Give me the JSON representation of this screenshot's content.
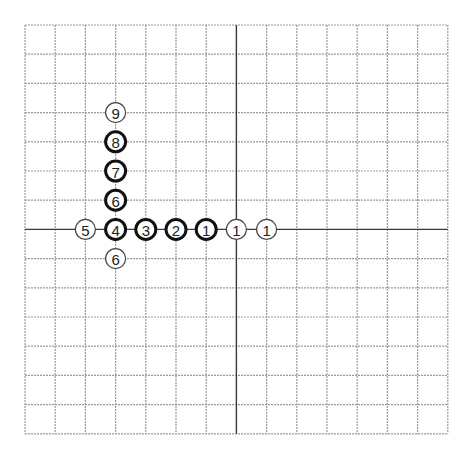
{
  "board": {
    "origin": [
      25,
      25
    ],
    "cols": 14,
    "rows": 14,
    "cell_w": 30.2,
    "cell_h": 29.2,
    "axis_col": 7,
    "axis_row": 7,
    "colors": {
      "grid": "#9a9a9a",
      "axis": "#3a3a3a",
      "stone_fill": "#ffffff",
      "stone_thick_stroke": "#111111",
      "stone_thin_stroke": "#444444",
      "label": "#222222"
    }
  },
  "stones": [
    {
      "label": "5",
      "col": 2,
      "row": 7,
      "style": "thin"
    },
    {
      "label": "4",
      "col": 3,
      "row": 7,
      "style": "thick"
    },
    {
      "label": "3",
      "col": 4,
      "row": 7,
      "style": "thick"
    },
    {
      "label": "2",
      "col": 5,
      "row": 7,
      "style": "thick"
    },
    {
      "label": "1",
      "col": 6,
      "row": 7,
      "style": "thick"
    },
    {
      "label": "1",
      "col": 7,
      "row": 7,
      "style": "thin"
    },
    {
      "label": "1",
      "col": 8,
      "row": 7,
      "style": "thin"
    },
    {
      "label": "9",
      "col": 3,
      "row": 3,
      "style": "thin"
    },
    {
      "label": "8",
      "col": 3,
      "row": 4,
      "style": "thick"
    },
    {
      "label": "7",
      "col": 3,
      "row": 5,
      "style": "thick"
    },
    {
      "label": "6",
      "col": 3,
      "row": 6,
      "style": "thick"
    },
    {
      "label": "6",
      "col": 3,
      "row": 8,
      "style": "thin"
    }
  ]
}
